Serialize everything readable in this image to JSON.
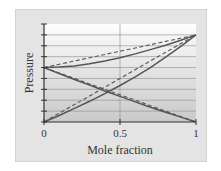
{
  "chart_data": {
    "type": "line",
    "title": "",
    "xlabel": "Mole fraction",
    "ylabel": "Pressure",
    "xlim": [
      0,
      1
    ],
    "ylim": [
      0,
      9
    ],
    "x_ticks": [
      "0",
      "0.5",
      "1"
    ],
    "y_ticks_count": 10,
    "y_tick_labels": [],
    "grid": {
      "horizontal": true,
      "vertical_at": [
        0.5
      ]
    },
    "legend": null,
    "x": [
      0,
      0.1,
      0.2,
      0.3,
      0.4,
      0.5,
      0.6,
      0.7,
      0.8,
      0.9,
      1.0
    ],
    "series": [
      {
        "name": "Total pressure (ideal, Raoult)",
        "style": "dashed",
        "values": [
          5.0,
          5.3,
          5.6,
          5.9,
          6.2,
          6.5,
          6.8,
          7.1,
          7.4,
          7.7,
          8.0
        ]
      },
      {
        "name": "Total pressure (real)",
        "style": "solid",
        "values": [
          5.0,
          5.05,
          5.15,
          5.35,
          5.6,
          5.9,
          6.25,
          6.65,
          7.05,
          7.5,
          8.0
        ]
      },
      {
        "name": "Partial pressure A (ideal)",
        "style": "dashed",
        "values": [
          0.0,
          0.8,
          1.6,
          2.4,
          3.2,
          4.0,
          4.8,
          5.6,
          6.4,
          7.2,
          8.0
        ]
      },
      {
        "name": "Partial pressure A (real)",
        "style": "solid",
        "values": [
          0.0,
          0.6,
          1.25,
          1.9,
          2.6,
          3.35,
          4.15,
          5.0,
          5.95,
          6.95,
          8.0
        ]
      },
      {
        "name": "Partial pressure B (ideal)",
        "style": "dashed",
        "values": [
          5.0,
          4.5,
          4.0,
          3.5,
          3.0,
          2.5,
          2.0,
          1.5,
          1.0,
          0.5,
          0.0
        ]
      },
      {
        "name": "Partial pressure B (real)",
        "style": "solid",
        "values": [
          5.0,
          4.45,
          3.9,
          3.4,
          2.85,
          2.35,
          1.85,
          1.35,
          0.9,
          0.45,
          0.0
        ]
      }
    ]
  },
  "labels": {
    "ylabel": "Pressure",
    "xlabel": "Mole fraction",
    "xtick0": "0",
    "xtick1": "0.5",
    "xtick2": "1"
  },
  "colors": {
    "panel_bg": "#e4e4e4",
    "plot_top": "#ffffff",
    "plot_bottom": "#c8c8c8",
    "line": "#555555",
    "axis": "#333333",
    "grid": "#8a8a8a"
  }
}
